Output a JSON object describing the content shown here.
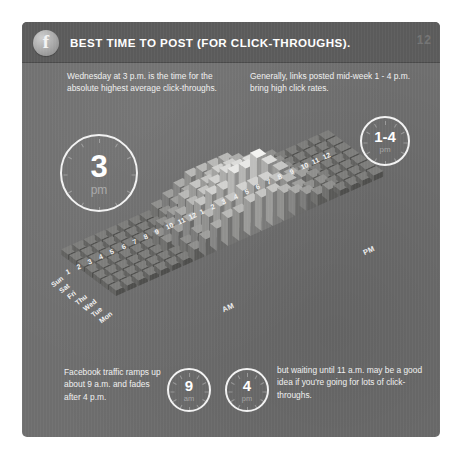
{
  "header": {
    "logo_icon": "facebook-f-icon",
    "logo_letter": "f",
    "title": "BEST TIME TO POST (FOR CLICK-THROUGHS).",
    "corner_mark": "12"
  },
  "notes": {
    "top_left": "Wednesday at 3 p.m. is the time for the absolute highest average click-throughs.",
    "top_right": "Generally, links posted mid-week 1 - 4 p.m. bring high click rates.",
    "bottom_left": "Facebook traffic ramps up about 9 a.m. and fades after 4 p.m.",
    "bottom_right": "but waiting until 11 a.m. may be a good idea if you're going for lots of click-throughs."
  },
  "clocks": [
    {
      "name": "peak-hour",
      "value": "3",
      "period": "pm"
    },
    {
      "name": "peak-range",
      "value": "1-4",
      "period": "pm"
    },
    {
      "name": "ramp-up-hour",
      "value": "9",
      "period": "am"
    },
    {
      "name": "fade-hour",
      "value": "4",
      "period": "pm"
    }
  ],
  "colors": {
    "panel_bg": "#6e6e6e",
    "header_bg": "#5b5b5b",
    "text": "#f0f0f0",
    "accent_ring": "#f2f2f2",
    "bar_high": "#f2f2f0",
    "bar_low": "#7d7d7b"
  },
  "chart_data": {
    "type": "heatmap",
    "title": "Best time to post (for click-throughs)",
    "render": "3d-bar-surface",
    "xlabel": "Hour of day",
    "ylabel": "Day of week",
    "zlabel": "Average click-throughs",
    "grid": false,
    "legend": false,
    "axis_titles": {
      "morning": "AM",
      "evening": "PM"
    },
    "categories_y": [
      "Mon",
      "Tue",
      "Wed",
      "Thu",
      "Fri",
      "Sat",
      "Sun"
    ],
    "categories_x": [
      "1",
      "2",
      "3",
      "4",
      "5",
      "6",
      "7",
      "8",
      "9",
      "10",
      "11",
      "12",
      "1",
      "2",
      "3",
      "4",
      "5",
      "6",
      "7",
      "8",
      "9",
      "10",
      "11",
      "12"
    ],
    "x_tick_labels_am": [
      "1",
      "2",
      "3",
      "4",
      "5",
      "6",
      "7",
      "8",
      "9",
      "10",
      "11",
      "12"
    ],
    "x_tick_labels_pm": [
      "1",
      "2",
      "3",
      "4",
      "5",
      "6",
      "7",
      "8",
      "9",
      "10",
      "11",
      "12"
    ],
    "zlim": [
      0,
      10
    ],
    "series": [
      {
        "name": "Mon",
        "values": [
          1,
          1,
          1,
          1,
          1,
          1,
          1,
          2,
          3,
          4,
          5,
          5,
          6,
          6,
          6,
          5,
          4,
          3,
          2,
          2,
          1,
          1,
          1,
          1
        ]
      },
      {
        "name": "Tue",
        "values": [
          1,
          1,
          1,
          1,
          1,
          1,
          1,
          2,
          3,
          5,
          6,
          6,
          7,
          7,
          7,
          6,
          5,
          3,
          2,
          2,
          1,
          1,
          1,
          1
        ]
      },
      {
        "name": "Wed",
        "values": [
          1,
          1,
          1,
          1,
          1,
          1,
          2,
          3,
          4,
          6,
          7,
          7,
          9,
          9,
          10,
          8,
          6,
          4,
          3,
          2,
          1,
          1,
          1,
          1
        ]
      },
      {
        "name": "Thu",
        "values": [
          1,
          1,
          1,
          1,
          1,
          1,
          2,
          3,
          4,
          5,
          6,
          7,
          8,
          8,
          8,
          7,
          5,
          3,
          2,
          2,
          1,
          1,
          1,
          1
        ]
      },
      {
        "name": "Fri",
        "values": [
          1,
          1,
          1,
          1,
          1,
          1,
          1,
          2,
          3,
          5,
          6,
          6,
          7,
          7,
          6,
          5,
          4,
          3,
          2,
          1,
          1,
          1,
          1,
          1
        ]
      },
      {
        "name": "Sat",
        "values": [
          1,
          1,
          1,
          1,
          1,
          1,
          1,
          1,
          2,
          3,
          4,
          4,
          5,
          5,
          4,
          4,
          3,
          2,
          2,
          1,
          1,
          1,
          1,
          1
        ]
      },
      {
        "name": "Sun",
        "values": [
          1,
          1,
          1,
          1,
          1,
          1,
          1,
          1,
          2,
          3,
          4,
          5,
          5,
          5,
          5,
          4,
          3,
          2,
          2,
          1,
          1,
          1,
          1,
          1
        ]
      }
    ],
    "peak": {
      "day": "Wed",
      "hour": "3 PM",
      "value": 10
    },
    "annotations": [
      "Wednesday at 3 p.m. is the time for the absolute highest average click-throughs.",
      "Generally, links posted mid-week 1 - 4 p.m. bring high click rates.",
      "Facebook traffic ramps up about 9 a.m. and fades after 4 p.m.",
      "but waiting until 11 a.m. may be a good idea if you're going for lots of click-throughs."
    ]
  }
}
